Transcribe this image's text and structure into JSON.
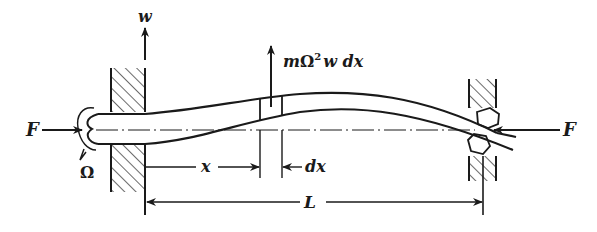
{
  "diagram": {
    "labels": {
      "axial_force_left": "F",
      "axial_force_right": "F",
      "rotation": "Ω",
      "deflection": "w",
      "element_force": "mΩ²w dx",
      "element_force_m": "m",
      "element_force_omega": "Ω",
      "element_force_sq": "2",
      "element_force_rest": "w dx",
      "position": "x",
      "element_width": "dx",
      "length": "L"
    },
    "colors": {
      "stroke": "#1a1a1a",
      "background": "#ffffff"
    }
  }
}
